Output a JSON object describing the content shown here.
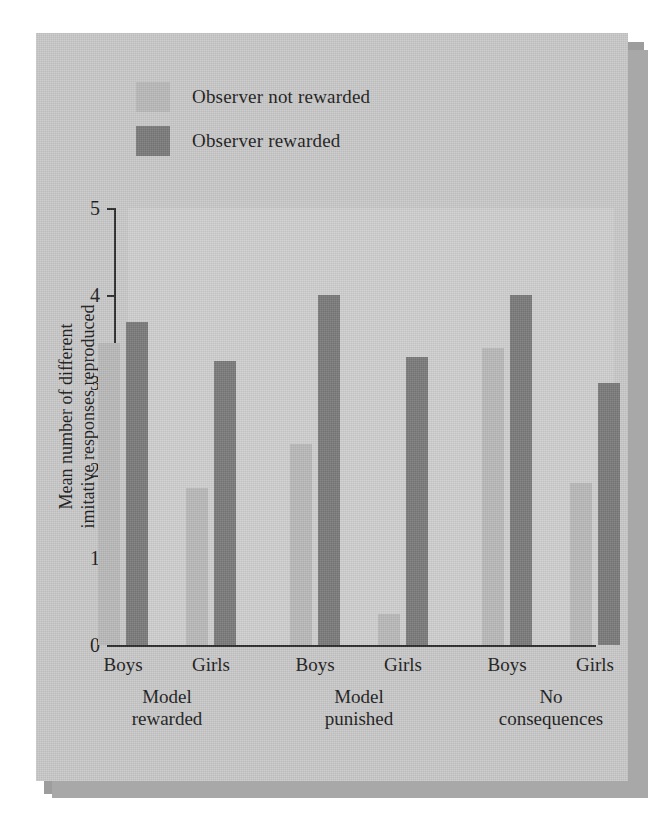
{
  "figure": {
    "panel_background": "#c9c9c9",
    "plot_background": "#cfcfcf",
    "shadow_color": "#9d9d9d",
    "axis_color": "#2b2b2b"
  },
  "legend": {
    "position": "top-left",
    "entries": [
      {
        "label": "Observer not rewarded",
        "color": "#b9b9b9"
      },
      {
        "label": "Observer rewarded",
        "color": "#7a7a7a"
      }
    ]
  },
  "chart_data": {
    "type": "bar",
    "title": "",
    "subtitle": "",
    "xlabel": "",
    "ylabel": "Mean number of different imitative responses reproduced",
    "ylabel_line1": "Mean number of different",
    "ylabel_line2": "imitative responses reproduced",
    "ylim": [
      0,
      5
    ],
    "yticks": [
      0,
      1,
      2,
      3,
      4,
      5
    ],
    "ytick_labels": [
      "0",
      "1",
      "2",
      "3",
      "4",
      "5"
    ],
    "grid": false,
    "legend_position": "top-left",
    "categories": [
      "Boys",
      "Girls",
      "Boys",
      "Girls",
      "Boys",
      "Girls"
    ],
    "groups": [
      {
        "label_line1": "Model",
        "label_line2": "rewarded"
      },
      {
        "label_line1": "Model",
        "label_line2": "punished"
      },
      {
        "label_line1": "No",
        "label_line2": "consequences"
      }
    ],
    "series": [
      {
        "name": "Observer not rewarded",
        "color": "#b9b9b9",
        "values": [
          3.45,
          1.8,
          2.3,
          0.35,
          3.4,
          1.85
        ]
      },
      {
        "name": "Observer rewarded",
        "color": "#7a7a7a",
        "values": [
          3.7,
          3.25,
          4.0,
          3.3,
          4.0,
          3.0
        ]
      }
    ]
  }
}
